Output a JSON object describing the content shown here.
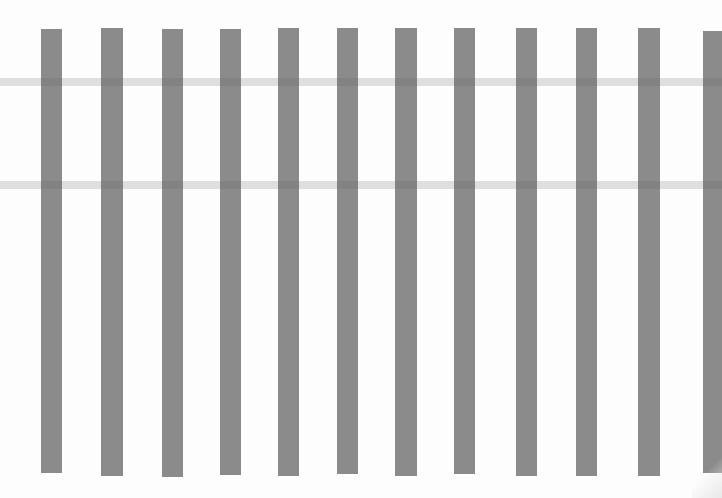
{
  "image": {
    "description": "Scanned print of evenly spaced gray vertical bars on white paper",
    "background": "#fdfdfd",
    "bar_color": "#8b8b8b",
    "bars": [
      {
        "x": 41,
        "y": 29,
        "w": 21,
        "h": 444
      },
      {
        "x": 101,
        "y": 28,
        "w": 22,
        "h": 448
      },
      {
        "x": 162,
        "y": 29,
        "w": 21,
        "h": 448
      },
      {
        "x": 220,
        "y": 29,
        "w": 21,
        "h": 446
      },
      {
        "x": 278,
        "y": 28,
        "w": 21,
        "h": 448
      },
      {
        "x": 337,
        "y": 28,
        "w": 21,
        "h": 446
      },
      {
        "x": 395,
        "y": 28,
        "w": 22,
        "h": 448
      },
      {
        "x": 454,
        "y": 28,
        "w": 21,
        "h": 446
      },
      {
        "x": 516,
        "y": 28,
        "w": 21,
        "h": 448
      },
      {
        "x": 576,
        "y": 28,
        "w": 21,
        "h": 448
      },
      {
        "x": 638,
        "y": 28,
        "w": 22,
        "h": 448
      },
      {
        "x": 703,
        "y": 31,
        "w": 19,
        "h": 442
      }
    ],
    "bands": [
      {
        "y": 78
      },
      {
        "y": 181
      }
    ]
  }
}
